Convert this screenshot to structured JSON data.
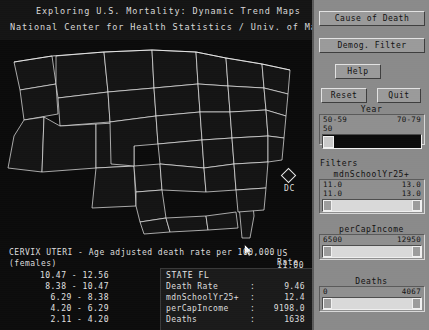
{
  "title": {
    "line1": "Exploring U.S. Mortality: Dynamic Trend Maps",
    "line2": "National Center for Health Statistics / Univ. of Maryland"
  },
  "map": {
    "dc_label": "DC",
    "us_rate_label": "US Rate",
    "us_rate_value": "11.00",
    "selected_state": "FL"
  },
  "caption": {
    "line1": "CERVIX UTERI - Age adjusted death rate per 100,000",
    "line2": "(females)"
  },
  "legend": {
    "ranges": [
      "10.47 - 12.56",
      "8.38 - 10.47",
      "6.29 - 8.38",
      "4.20 - 6.29",
      "2.11 - 4.20"
    ]
  },
  "state_info": {
    "header": "STATE FL",
    "rows": [
      {
        "label": "Death Rate",
        "sep": ":",
        "value": "9.46"
      },
      {
        "label": "mdnSchoolYr25+",
        "sep": ":",
        "value": "12.4"
      },
      {
        "label": "perCapIncome",
        "sep": ":",
        "value": "9198.0"
      },
      {
        "label": "Deaths",
        "sep": ":",
        "value": "1638"
      }
    ]
  },
  "panel": {
    "buttons": {
      "cause_of_death": "Cause of Death",
      "demog_filter": "Demog. Filter",
      "help": "Help",
      "reset": "Reset",
      "quit": "Quit"
    },
    "year": {
      "heading": "Year",
      "min_label": "50-59",
      "max_label": "70-79",
      "current": "50"
    },
    "filters_heading": "Filters",
    "school": {
      "heading": "mdnSchoolYr25+",
      "range_min": "11.0",
      "range_max": "13.0",
      "value_min": "11.0",
      "value_max": "13.0"
    },
    "income": {
      "heading": "perCapIncome",
      "range_min": "6500",
      "range_max": "12950",
      "value_min": "6500",
      "value_max": "12950"
    },
    "deaths": {
      "heading": "Deaths",
      "range_min": "0",
      "range_max": "4067",
      "value_min": "0",
      "value_max": "4067"
    }
  },
  "colors": {
    "panel_bg": "#8a8a8a",
    "map_bg": "#0b0b0b",
    "text": "#dcdcdc",
    "border": "#ffffff"
  }
}
